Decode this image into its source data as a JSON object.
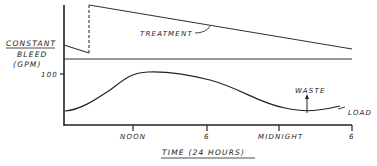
{
  "diagram": {
    "y_axis_label": {
      "line1": "CONSTANT",
      "line2": "BLEED",
      "line3": "(GPM)"
    },
    "y_tick": "100",
    "x_axis_title": "TIME (24 HOURS)",
    "x_ticks": [
      "NOON",
      "6",
      "MIDNIGHT",
      "6"
    ],
    "annotations": {
      "treatment": "TREATMENT",
      "waste": "WASTE",
      "load": "LOAD"
    },
    "colors": {
      "ink": "#222222",
      "background": "#ffffff"
    }
  }
}
